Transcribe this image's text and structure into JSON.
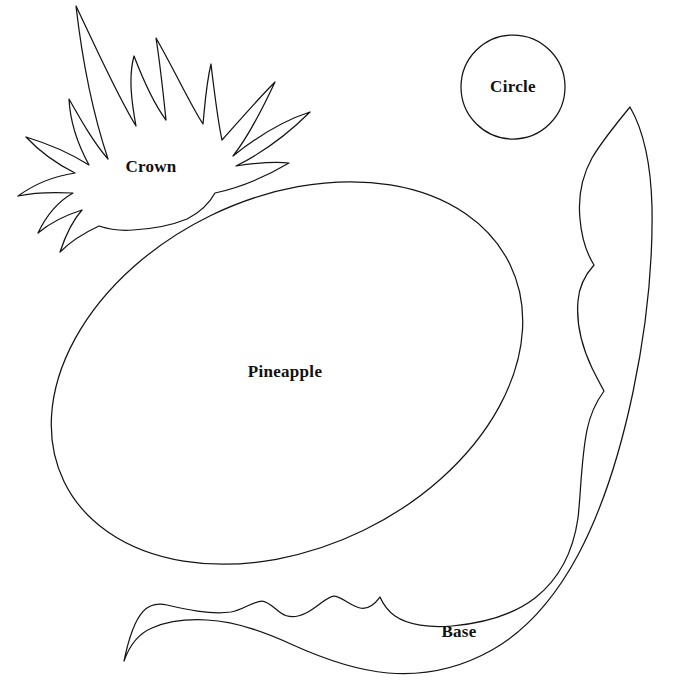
{
  "document": {
    "title": "Pineapple Pattern Template",
    "background_color": "#ffffff",
    "stroke_color": "#141414",
    "width": 682,
    "height": 686
  },
  "pieces": [
    {
      "id": "crown",
      "label": "Crown",
      "label_x": 151,
      "label_y": 168,
      "description": "spiky pineapple crown outline, upper left"
    },
    {
      "id": "circle",
      "label": "Circle",
      "label_x": 513,
      "label_y": 87,
      "description": "plain circle outline, upper right",
      "center_x": 513,
      "center_y": 87,
      "radius": 52
    },
    {
      "id": "pineapple",
      "label": "Pineapple",
      "label_x": 285,
      "label_y": 373,
      "description": "large tilted oval body outline, center"
    },
    {
      "id": "base",
      "label": "Base",
      "label_x": 459,
      "label_y": 633,
      "description": "long curved scalloped base leaf outline, bottom and right"
    }
  ]
}
